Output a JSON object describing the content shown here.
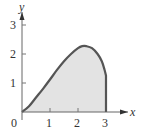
{
  "chart_data": {
    "type": "area",
    "title": "",
    "xlabel": "x",
    "ylabel": "y",
    "x_ticks": [
      "1",
      "2",
      "3"
    ],
    "y_ticks": [
      "1",
      "2",
      "3"
    ],
    "origin_label": "0",
    "xlim": [
      0,
      3.3
    ],
    "ylim": [
      0,
      3.3
    ],
    "grid": false,
    "legend": null,
    "series": [
      {
        "name": "curve",
        "x": [
          0,
          0.25,
          0.5,
          0.75,
          1.0,
          1.25,
          1.5,
          1.75,
          2.0,
          2.15,
          2.3,
          2.5,
          2.7,
          2.85,
          2.95,
          3.0
        ],
        "values": [
          0,
          0.2,
          0.5,
          0.8,
          1.12,
          1.45,
          1.75,
          2.0,
          2.2,
          2.27,
          2.27,
          2.2,
          2.0,
          1.75,
          1.45,
          1.25
        ]
      }
    ],
    "shaded_region": "area under curve from x=0 to x=3",
    "colors": {
      "fill": "#e3e3e3",
      "curve": "#555555",
      "axis": "#666666"
    }
  }
}
